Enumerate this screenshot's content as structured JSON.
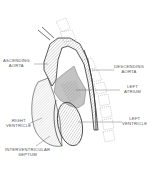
{
  "diagram": {
    "type": "anatomical-illustration",
    "colors": {
      "outline": "#333333",
      "hatch": "#888888",
      "shade": "#b8b8b8",
      "spine": "#999999",
      "label": "#555555"
    },
    "labels": {
      "ascending_aorta": {
        "line1": "ASCENDING",
        "line2": "AORTA"
      },
      "descending_aorta": {
        "line1": "DESCENDING",
        "line2": "AORTA"
      },
      "left_atrium": {
        "line1": "LEFT",
        "line2": "ATRIUM"
      },
      "right_ventricle": {
        "line1": "RIGHT",
        "line2": "VENTRICLE"
      },
      "left_ventricle": {
        "line1": "LEFT",
        "line2": "VENTRICLE"
      },
      "interventricular_septum": {
        "line1": "INTERVENTRICULAR",
        "line2": "SEPTUM"
      }
    }
  }
}
